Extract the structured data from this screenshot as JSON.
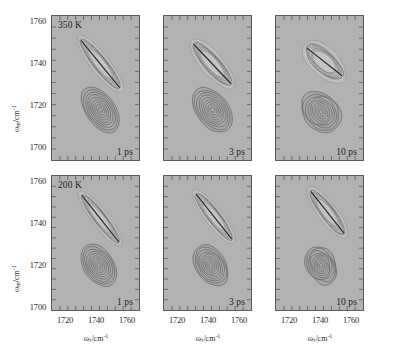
{
  "figure": {
    "axis_x_title": "ω",
    "axis_x_title_sub": "τ",
    "axis_x_title_unit": "/cm",
    "axis_x_title_sup": "-1",
    "axis_y_title": "ω",
    "axis_y_title_sub": "m",
    "axis_y_title_unit": "/cm",
    "axis_y_title_sup": "-1",
    "background_color": "#b2b2b2",
    "contour_color": "#5e5e5e",
    "contour_color_light": "#d8d8d8",
    "frame_color": "#5a5a5a"
  },
  "axes": {
    "x_ticks": [
      1720,
      1740,
      1760
    ],
    "x_tick_labels": [
      "1720",
      "1740",
      "1760"
    ],
    "y_ticks": [
      1700,
      1720,
      1740,
      1760
    ],
    "y_tick_labels": [
      "1700",
      "1720",
      "1740",
      "1760"
    ],
    "x_min": 1712,
    "x_max": 1766,
    "y_min": 1700,
    "y_max": 1766
  },
  "chart_data": {
    "type": "heatmap",
    "title": "",
    "xlabel": "ω_τ/cm^-1",
    "ylabel": "ω_m/cm^-1",
    "xlim": [
      1712,
      1766
    ],
    "ylim": [
      1700,
      1766
    ],
    "grid": false,
    "legend": "none",
    "rows": [
      {
        "label": "350 K",
        "temperature_K": 350
      },
      {
        "label": "200 K",
        "temperature_K": 200
      }
    ],
    "columns": [
      {
        "label": "1 ps",
        "waiting_time_ps": 1
      },
      {
        "label": "3 ps",
        "waiting_time_ps": 3
      },
      {
        "label": "10 ps",
        "waiting_time_ps": 10
      }
    ],
    "panels": [
      {
        "row_label": "350 K",
        "col_label": "1 ps",
        "positive_peak": {
          "x": 1742,
          "y": 1744,
          "tilt_deg": 42,
          "elongation": "strong-diagonal"
        },
        "negative_peak": {
          "x": 1742,
          "y": 1723,
          "tilt_deg": 38,
          "elongation": "diagonal"
        },
        "contour_levels": 9
      },
      {
        "row_label": "350 K",
        "col_label": "3 ps",
        "positive_peak": {
          "x": 1742,
          "y": 1744,
          "tilt_deg": 38,
          "elongation": "diagonal"
        },
        "negative_peak": {
          "x": 1742,
          "y": 1723,
          "tilt_deg": 32,
          "elongation": "diagonal"
        },
        "contour_levels": 9
      },
      {
        "row_label": "350 K",
        "col_label": "10 ps",
        "positive_peak": {
          "x": 1742,
          "y": 1745,
          "tilt_deg": 30,
          "elongation": "round"
        },
        "negative_peak": {
          "x": 1740,
          "y": 1722,
          "tilt_deg": 20,
          "elongation": "round"
        },
        "contour_levels": 9
      },
      {
        "row_label": "200 K",
        "col_label": "1 ps",
        "positive_peak": {
          "x": 1742,
          "y": 1745,
          "tilt_deg": 45,
          "elongation": "strong-diagonal"
        },
        "negative_peak": {
          "x": 1741,
          "y": 1722,
          "tilt_deg": 40,
          "elongation": "diagonal"
        },
        "contour_levels": 9
      },
      {
        "row_label": "200 K",
        "col_label": "3 ps",
        "positive_peak": {
          "x": 1743,
          "y": 1746,
          "tilt_deg": 45,
          "elongation": "strong-diagonal"
        },
        "negative_peak": {
          "x": 1741,
          "y": 1722,
          "tilt_deg": 38,
          "elongation": "diagonal"
        },
        "contour_levels": 9
      },
      {
        "row_label": "200 K",
        "col_label": "10 ps",
        "positive_peak": {
          "x": 1744,
          "y": 1748,
          "tilt_deg": 45,
          "elongation": "strong-diagonal"
        },
        "negative_peak": {
          "x": 1740,
          "y": 1722,
          "tilt_deg": 35,
          "elongation": "irregular"
        },
        "contour_levels": 9
      }
    ]
  }
}
